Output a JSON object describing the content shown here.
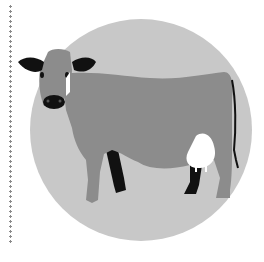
{
  "illustration": {
    "subject": "dairy cow",
    "alt": "Gray dairy cow standing inside a light gray circle",
    "colors": {
      "background": "#ffffff",
      "circle": "#c8c8c8",
      "cow_body": "#8c8c8c",
      "cow_dark": "#111111",
      "udder": "#ffffff",
      "dotted_rule": "#8a8a8a"
    }
  }
}
